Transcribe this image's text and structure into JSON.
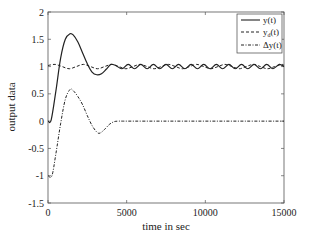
{
  "chart_data": {
    "type": "line",
    "title": "",
    "xlabel": "time in sec",
    "ylabel": "output data",
    "xlim": [
      0,
      15000
    ],
    "ylim": [
      -1.5,
      2
    ],
    "xticks": [
      0,
      5000,
      10000,
      15000
    ],
    "xtick_labels": [
      "0",
      "5000",
      "10000",
      "15000"
    ],
    "yticks": [
      -1.5,
      -1,
      -0.5,
      0,
      0.5,
      1,
      1.5,
      2
    ],
    "ytick_labels": [
      "-1.5",
      "-1",
      "-0.5",
      "0",
      "0.5",
      "1",
      "1.5",
      "2"
    ],
    "grid": false,
    "legend_position": "upper right",
    "series": [
      {
        "name": "y(t)",
        "style": "solid",
        "x": [
          0,
          200,
          500,
          800,
          1100,
          1400,
          1600,
          1900,
          2200,
          2500,
          2800,
          3100,
          3400,
          3700,
          4000,
          4300,
          4700,
          5100,
          5500,
          5900,
          6300,
          6700,
          7100,
          7500,
          7900,
          8300,
          8700,
          9100,
          9500,
          9900,
          10300,
          10700,
          11100,
          11500,
          11900,
          12300,
          12700,
          13100,
          13500,
          13900,
          14300,
          14700,
          15000
        ],
        "values": [
          0,
          0.02,
          0.55,
          1.15,
          1.5,
          1.6,
          1.58,
          1.45,
          1.25,
          1.05,
          0.9,
          0.85,
          0.87,
          0.95,
          1.04,
          1.02,
          0.96,
          1.04,
          0.96,
          1.04,
          0.96,
          1.04,
          0.96,
          1.04,
          0.96,
          1.04,
          0.96,
          1.04,
          0.96,
          1.04,
          0.96,
          1.04,
          0.96,
          1.04,
          0.96,
          1.04,
          0.96,
          1.04,
          0.96,
          1.04,
          0.96,
          1.04,
          1.0
        ]
      },
      {
        "name": "y_d(t)",
        "style": "dashed",
        "x": [
          0,
          450,
          900,
          1350,
          1800,
          2250,
          2700,
          3150,
          3600,
          4050,
          4500,
          4950,
          5400,
          5850,
          6300,
          6750,
          7200,
          7650,
          8100,
          8550,
          9000,
          9450,
          9900,
          10350,
          10800,
          11250,
          11700,
          12150,
          12600,
          13050,
          13500,
          13950,
          14400,
          14850,
          15000
        ],
        "values": [
          1.02,
          1.04,
          1.0,
          0.96,
          1.0,
          1.04,
          1.0,
          0.96,
          1.0,
          1.04,
          1.0,
          0.96,
          1.0,
          1.04,
          1.0,
          0.96,
          1.0,
          1.04,
          1.0,
          0.96,
          1.0,
          1.04,
          1.0,
          0.96,
          1.0,
          1.04,
          1.0,
          0.96,
          1.0,
          1.04,
          1.0,
          0.96,
          1.0,
          1.04,
          1.02
        ]
      },
      {
        "name": "Δy(t)",
        "style": "dashdot",
        "x": [
          0,
          250,
          500,
          800,
          1100,
          1400,
          1600,
          1900,
          2200,
          2500,
          2800,
          3100,
          3300,
          3600,
          3900,
          4200,
          4500,
          5000,
          7500,
          10000,
          12500,
          15000
        ],
        "values": [
          -1.0,
          -1.0,
          -0.6,
          -0.05,
          0.4,
          0.58,
          0.56,
          0.45,
          0.3,
          0.1,
          -0.08,
          -0.2,
          -0.22,
          -0.15,
          -0.06,
          -0.01,
          0,
          0,
          0,
          0,
          0,
          0
        ]
      }
    ]
  },
  "legend": {
    "items": [
      {
        "label": "y(t)",
        "style": "solid"
      },
      {
        "label_main": "y",
        "label_sub": "d",
        "label_tail": "(t)",
        "style": "dashed"
      },
      {
        "label": "Δy(t)",
        "style": "dashdot"
      }
    ]
  },
  "colors": {
    "line": "#222222",
    "axis": "#555555",
    "background": "#ffffff"
  }
}
